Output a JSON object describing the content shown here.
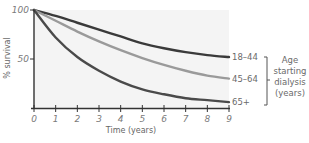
{
  "chart_data": {
    "type": "line",
    "title": "",
    "xlabel": "Time (years)",
    "ylabel": "% survival",
    "xlim": [
      0,
      9
    ],
    "ylim": [
      0,
      100
    ],
    "x_ticks": [
      "0",
      "1",
      "2",
      "3",
      "4",
      "5",
      "6",
      "7",
      "8",
      "9"
    ],
    "y_ticks": [
      "50",
      "100"
    ],
    "grid": false,
    "x": [
      0,
      1,
      2,
      3,
      4,
      5,
      6,
      7,
      8,
      9
    ],
    "series": [
      {
        "name": "18–44",
        "color": "#3a3a3a",
        "values": [
          100,
          94,
          87,
          80,
          73,
          66,
          61,
          57,
          54,
          52
        ]
      },
      {
        "name": "45–64",
        "color": "#9a9a9a",
        "values": [
          100,
          89,
          78,
          68,
          59,
          51,
          44,
          38,
          33,
          30
        ]
      },
      {
        "name": "65+",
        "color": "#4a4a4a",
        "values": [
          100,
          72,
          52,
          38,
          27,
          19,
          14,
          10,
          8,
          6
        ]
      }
    ],
    "legend": {
      "title_lines": [
        "Age",
        "starting",
        "dialysis",
        "(years)"
      ],
      "placement": "right"
    }
  }
}
